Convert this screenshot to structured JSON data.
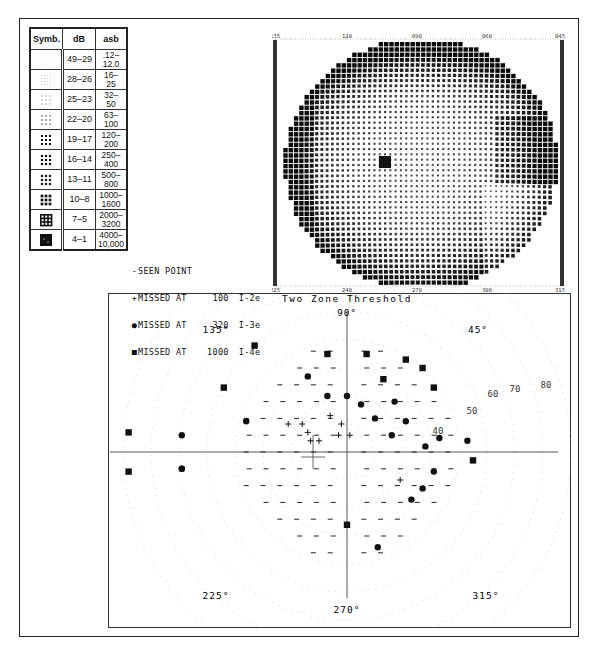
{
  "legend": {
    "headers": {
      "symbol": "Symb.",
      "db": "dB",
      "asb": "asb"
    },
    "rows": [
      {
        "db": "49–29",
        "asb_top": ".12–",
        "asb_bottom": "12.0",
        "density": 1
      },
      {
        "db": "28–26",
        "asb_top": "16–",
        "asb_bottom": "25",
        "density": 2
      },
      {
        "db": "25–23",
        "asb_top": "32–",
        "asb_bottom": "50",
        "density": 3
      },
      {
        "db": "22–20",
        "asb_top": "63–",
        "asb_bottom": "100",
        "density": 4
      },
      {
        "db": "19–17",
        "asb_top": "120–",
        "asb_bottom": "200",
        "density": 5
      },
      {
        "db": "16–14",
        "asb_top": "250–",
        "asb_bottom": "400",
        "density": 6
      },
      {
        "db": "13–11",
        "asb_top": "500–",
        "asb_bottom": "800",
        "density": 7
      },
      {
        "db": "10–8",
        "asb_top": "1000–",
        "asb_bottom": "1600",
        "density": 8
      },
      {
        "db": "7–5",
        "asb_top": "2000–",
        "asb_bottom": "3200",
        "density": 9
      },
      {
        "db": "4–1",
        "asb_top": "4000–",
        "asb_bottom": "10,000",
        "density": 10
      }
    ]
  },
  "key": {
    "seen": {
      "glyph": "-",
      "label": "SEEN POINT"
    },
    "items": [
      {
        "glyph": "+",
        "symbol": "cross",
        "label": "MISSED AT",
        "value": "100",
        "stimulus": "I-2e"
      },
      {
        "glyph": "●",
        "symbol": "dot",
        "label": "MISSED AT",
        "value": "320",
        "stimulus": "I-3e"
      },
      {
        "glyph": "■",
        "symbol": "square",
        "label": "MISSED AT",
        "value": "1000",
        "stimulus": "I-4e"
      }
    ]
  },
  "greyscale": {
    "top_labels": [
      "135",
      "120",
      "090",
      "060",
      "045"
    ],
    "bottom_labels": [
      "225",
      "240",
      "270",
      "300",
      "315"
    ]
  },
  "chart_data": {
    "type": "scatter",
    "title": "Two Zone Threshold",
    "angle_labels": [
      "90°",
      "45°",
      "135°",
      "225°",
      "270°",
      "315°"
    ],
    "ring_labels": [
      "40",
      "50",
      "60",
      "70",
      "80"
    ],
    "ring_eccentricities_deg": [
      10,
      20,
      30,
      40,
      50,
      60,
      70,
      80
    ],
    "legend": [
      "- seen point",
      "+ missed at 100 I-2e",
      "● missed at 320 I-3e",
      "■ missed at 1000 I-4e"
    ],
    "points": {
      "square": [
        [
          -78,
          7
        ],
        [
          -78,
          -7
        ],
        [
          -44,
          23
        ],
        [
          -7,
          35
        ],
        [
          -33,
          38
        ],
        [
          7,
          35
        ],
        [
          13,
          26
        ],
        [
          21,
          33
        ],
        [
          27,
          30
        ],
        [
          31,
          23
        ],
        [
          45,
          -3
        ],
        [
          0,
          -26
        ]
      ],
      "dot": [
        [
          -59,
          6
        ],
        [
          -59,
          -6
        ],
        [
          -36,
          11
        ],
        [
          -14,
          27
        ],
        [
          -7,
          20
        ],
        [
          0,
          20
        ],
        [
          5,
          17
        ],
        [
          17,
          18
        ],
        [
          10,
          12
        ],
        [
          21,
          11
        ],
        [
          16,
          6
        ],
        [
          33,
          5
        ],
        [
          28,
          2
        ],
        [
          31,
          -7
        ],
        [
          27,
          -13
        ],
        [
          23,
          -17
        ],
        [
          11,
          -34
        ],
        [
          43,
          4
        ],
        [
          -59,
          -6
        ]
      ],
      "cross": [
        [
          -21,
          10
        ],
        [
          -16,
          10
        ],
        [
          -14,
          7
        ],
        [
          -6,
          13
        ],
        [
          -2,
          10
        ],
        [
          1,
          6
        ],
        [
          -13,
          4
        ],
        [
          -10,
          4
        ],
        [
          -3,
          6
        ],
        [
          19,
          -10
        ]
      ]
    }
  },
  "caption": "Figure caption (illegible)"
}
